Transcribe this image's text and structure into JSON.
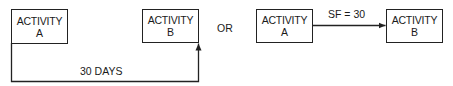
{
  "left_diagram": {
    "activity_a": {
      "line1": "ACTIVITY",
      "line2": "A"
    },
    "activity_b": {
      "line1": "ACTIVITY",
      "line2": "B"
    },
    "link_label": "30 DAYS"
  },
  "separator": "OR",
  "right_diagram": {
    "activity_a": {
      "line1": "ACTIVITY",
      "line2": "A"
    },
    "activity_b": {
      "line1": "ACTIVITY",
      "line2": "B"
    },
    "link_label": "SF = 30"
  }
}
